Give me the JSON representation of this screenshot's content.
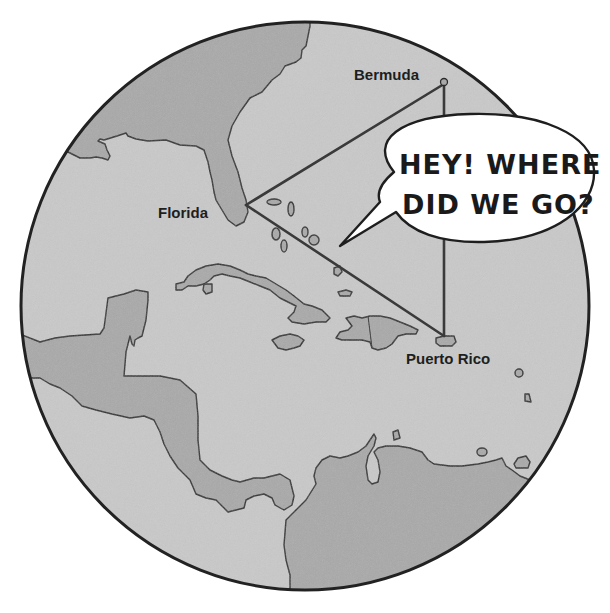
{
  "map": {
    "title": "Bermuda Triangle",
    "colors": {
      "background": "#ffffff",
      "water": "#c9c9c9",
      "land": "#a9a9a9",
      "outline": "#2b2b2b",
      "triangle": "#3a3a3a",
      "bubble_fill": "#ffffff"
    },
    "labels": {
      "bermuda": "Bermuda",
      "florida": "Florida",
      "puerto_rico": "Puerto Rico"
    },
    "triangle_vertices": {
      "bermuda": [
        444,
        84
      ],
      "florida": [
        246,
        205
      ],
      "puerto_rico": [
        444,
        336
      ]
    }
  },
  "speech_bubble": {
    "line1": "HEY! WHERE",
    "line2": "DID WE GO?"
  }
}
